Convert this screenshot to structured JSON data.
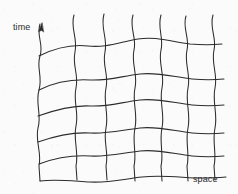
{
  "figure": {
    "kind": "hand-drawn-diagram",
    "background_color": "#fbfbfb",
    "ink_color": "#2c2c2c",
    "stroke_width": 1.05,
    "width": 238,
    "height": 194
  },
  "labels": {
    "time": "time",
    "space": "space"
  },
  "arrow": {
    "name": "time-axis-arrowhead",
    "points_to": "up",
    "tip_x": 42,
    "tip_y": 23
  },
  "chart_data": {
    "type": "line",
    "title": "",
    "xlabel": "space",
    "ylabel": "time",
    "grid": true,
    "legend": false,
    "vertical_curve_count": 7,
    "horizontal_curve_count": 6,
    "vertical_x_positions": [
      40,
      75,
      105,
      132,
      160,
      185,
      212
    ],
    "horizontal_y_positions": [
      48,
      82,
      110,
      140,
      165,
      180
    ],
    "series": [
      {
        "name": "time-line-1",
        "path": "M 40,24 C 36,36 44,44 40,56 C 36,68 43,76 39,90 C 35,104 42,114 38,128 C 35,142 42,152 39,166 L 40,181"
      },
      {
        "name": "time-line-2",
        "path": "M 74,15 C 70,28 78,38 75,52 C 72,66 79,74 76,88 C 73,102 79,112 76,126 C 73,140 79,152 76,166 L 77,180"
      },
      {
        "name": "time-line-3",
        "path": "M 104,14 C 100,28 108,38 105,52 C 102,66 109,74 106,88 C 103,102 109,114 106,128 C 103,142 109,152 106,166 L 107,180"
      },
      {
        "name": "time-line-4",
        "path": "M 133,15 C 129,28 137,38 134,50 C 131,64 138,74 135,88 C 132,102 138,114 135,128 C 132,142 137,154 134,166 L 135,181"
      },
      {
        "name": "time-line-5",
        "path": "M 161,15 C 157,28 164,38 161,50 C 158,64 165,74 162,88 C 159,102 165,114 162,128 C 159,142 164,154 161,166 L 162,181"
      },
      {
        "name": "time-line-6",
        "path": "M 186,16 C 182,28 190,38 187,50 C 184,64 191,74 188,88 C 185,102 191,114 188,128 C 185,142 190,154 187,166 L 188,181"
      },
      {
        "name": "time-line-7",
        "path": "M 213,15 C 209,28 217,38 214,50 C 211,64 218,74 215,88 C 212,102 218,114 215,128 C 212,142 217,154 214,166 L 215,180"
      },
      {
        "name": "space-line-1",
        "path": "M 39,56 C 55,48 70,44 88,46 C 106,48 120,42 138,39 C 156,36 172,42 190,44 C 202,45 212,45 222,44"
      },
      {
        "name": "space-line-2",
        "path": "M 39,90 C 55,82 72,79 90,80 C 108,81 122,76 140,74 C 158,72 174,77 192,79 C 203,80 214,80 224,79"
      },
      {
        "name": "space-line-3",
        "path": "M 38,116 C 55,110 72,105 90,106 C 108,107 122,102 140,100 C 158,98 174,103 192,105 C 203,106 214,106 224,105"
      },
      {
        "name": "space-line-4",
        "path": "M 38,142 C 55,136 72,132 90,133 C 108,134 122,130 140,128 C 158,126 174,131 192,133 C 203,134 214,134 224,133"
      },
      {
        "name": "space-line-5",
        "path": "M 39,164 C 55,158 72,155 90,156 C 108,157 122,153 140,151 C 158,149 174,154 192,156 C 203,157 214,157 224,156"
      },
      {
        "name": "space-line-6",
        "path": "M 40,181 C 56,179 72,181 90,182 C 108,183 124,179 142,177 C 160,175 176,177 194,178 C 205,178 216,178 226,177"
      }
    ]
  }
}
